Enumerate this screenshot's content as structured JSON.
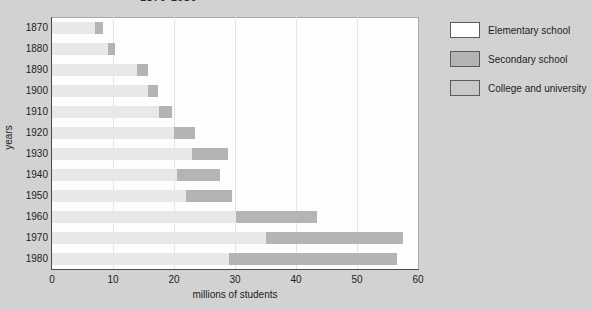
{
  "chart_data": {
    "type": "bar",
    "orientation": "horizontal",
    "stacked": true,
    "title": "1870-1980",
    "xlabel": "millions of students",
    "ylabel": "years",
    "xlim": [
      0,
      60
    ],
    "xticks": [
      0,
      10,
      20,
      30,
      40,
      50,
      60
    ],
    "grid": true,
    "grid_axis": "x",
    "legend_position": "right",
    "categories": [
      "1870",
      "1880",
      "1890",
      "1900",
      "1910",
      "1920",
      "1930",
      "1940",
      "1950",
      "1960",
      "1970",
      "1980"
    ],
    "series": [
      {
        "name": "Elementary school",
        "color": "#e8e8e8",
        "values": [
          7.0,
          9.2,
          14.0,
          15.8,
          17.5,
          20.0,
          23.0,
          20.5,
          22.0,
          30.2,
          35.0,
          29.0
        ]
      },
      {
        "name": "Secondary school",
        "color": "#b4b4b4",
        "values": [
          1.3,
          1.1,
          1.7,
          1.6,
          2.2,
          3.4,
          5.8,
          7.1,
          7.5,
          13.3,
          22.5,
          27.5
        ]
      }
    ],
    "totals": [
      8.3,
      10.3,
      15.7,
      17.4,
      19.7,
      23.4,
      28.8,
      27.6,
      29.5,
      43.5,
      57.5,
      56.5
    ]
  },
  "legend": {
    "items": [
      {
        "label": "Elementary school",
        "color": "#ffffff"
      },
      {
        "label": "Secondary school",
        "color": "#b4b4b4"
      },
      {
        "label": "College and university",
        "color": "#c9c9c9"
      }
    ]
  },
  "colors": {
    "page_background": "#d2d2d2",
    "plot_background": "#fdfdfd",
    "axis": "#4a4a4a",
    "gridline": "#e4e4e4"
  }
}
